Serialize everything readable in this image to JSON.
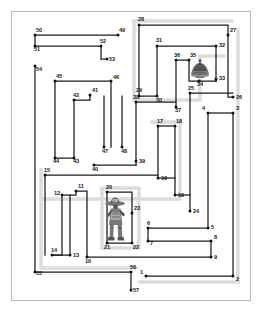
{
  "document": {
    "type": "maze-floorplan-diagram",
    "title": "",
    "canvas": {
      "width": 261,
      "height": 311
    },
    "background_color": "#ffffff",
    "frame_color": "#b9b9b9",
    "wall_color": "#1c1c1c",
    "halo_color": "#dcdcdc"
  },
  "frame": {
    "x": 11,
    "y": 11,
    "width": 239,
    "height": 289
  },
  "nodes": [
    {
      "id": "1",
      "x": 146,
      "y": 276,
      "label_dx": -6,
      "label_dy": -1
    },
    {
      "id": "2",
      "x": 233,
      "y": 276,
      "label_dx": 3,
      "label_dy": 6
    },
    {
      "id": "3",
      "x": 233,
      "y": 113,
      "label_dx": 3,
      "label_dy": -2
    },
    {
      "id": "4",
      "x": 208,
      "y": 113,
      "label_dx": -6,
      "label_dy": -2
    },
    {
      "id": "5",
      "x": 208,
      "y": 228,
      "label_dx": 3,
      "label_dy": 2
    },
    {
      "id": "6",
      "x": 148,
      "y": 228,
      "label_dx": -1,
      "label_dy": -2
    },
    {
      "id": "7",
      "x": 148,
      "y": 241,
      "label_dx": 2,
      "label_dy": 5
    },
    {
      "id": "8",
      "x": 211,
      "y": 241,
      "label_dx": 3,
      "label_dy": -1
    },
    {
      "id": "9",
      "x": 211,
      "y": 257,
      "label_dx": 3,
      "label_dy": 3
    },
    {
      "id": "10",
      "x": 87,
      "y": 257,
      "label_dx": -2,
      "label_dy": 7
    },
    {
      "id": "11",
      "x": 76,
      "y": 191,
      "label_dx": 2,
      "label_dy": -2
    },
    {
      "id": "12",
      "x": 62,
      "y": 195,
      "label_dx": -8,
      "label_dy": 1
    },
    {
      "id": "13",
      "x": 70,
      "y": 255,
      "label_dx": 3,
      "label_dy": 3
    },
    {
      "id": "14",
      "x": 52,
      "y": 255,
      "label_dx": -1,
      "label_dy": -2
    },
    {
      "id": "15",
      "x": 45,
      "y": 175,
      "label_dx": -1,
      "label_dy": -2
    },
    {
      "id": "16",
      "x": 158,
      "y": 178,
      "label_dx": 3,
      "label_dy": 3
    },
    {
      "id": "17",
      "x": 158,
      "y": 126,
      "label_dx": -1,
      "label_dy": -2
    },
    {
      "id": "18",
      "x": 175,
      "y": 126,
      "label_dx": 1,
      "label_dy": -2
    },
    {
      "id": "19",
      "x": 175,
      "y": 195,
      "label_dx": 3,
      "label_dy": 3
    },
    {
      "id": "20",
      "x": 107,
      "y": 192,
      "label_dx": -1,
      "label_dy": -2
    },
    {
      "id": "21",
      "x": 107,
      "y": 243,
      "label_dx": -3,
      "label_dy": 7
    },
    {
      "id": "22",
      "x": 132,
      "y": 243,
      "label_dx": 1,
      "label_dy": 7
    },
    {
      "id": "23",
      "x": 132,
      "y": 213,
      "label_dx": 2,
      "label_dy": -2
    },
    {
      "id": "24",
      "x": 190,
      "y": 211,
      "label_dx": 3,
      "label_dy": 3
    },
    {
      "id": "25",
      "x": 190,
      "y": 93,
      "label_dx": -2,
      "label_dy": -2
    },
    {
      "id": "26",
      "x": 233,
      "y": 97,
      "label_dx": 3,
      "label_dy": 3
    },
    {
      "id": "27",
      "x": 228,
      "y": 35,
      "label_dx": 2,
      "label_dy": -2
    },
    {
      "id": "28",
      "x": 139,
      "y": 25,
      "label_dx": -1,
      "label_dy": -3
    },
    {
      "id": "29",
      "x": 139,
      "y": 96,
      "label_dx": -3,
      "label_dy": -3
    },
    {
      "id": "30",
      "x": 157,
      "y": 96,
      "label_dx": -1,
      "label_dy": 7
    },
    {
      "id": "31",
      "x": 157,
      "y": 46,
      "label_dx": -1,
      "label_dy": -3
    },
    {
      "id": "32",
      "x": 216,
      "y": 46,
      "label_dx": 3,
      "label_dy": 2
    },
    {
      "id": "33",
      "x": 216,
      "y": 79,
      "label_dx": 3,
      "label_dy": 2
    },
    {
      "id": "34",
      "x": 199,
      "y": 81,
      "label_dx": -2,
      "label_dy": 6
    },
    {
      "id": "35",
      "x": 189,
      "y": 60,
      "label_dx": 1,
      "label_dy": -2
    },
    {
      "id": "36",
      "x": 176,
      "y": 60,
      "label_dx": -2,
      "label_dy": -2
    },
    {
      "id": "37",
      "x": 176,
      "y": 107,
      "label_dx": -1,
      "label_dy": 6
    },
    {
      "id": "38",
      "x": 136,
      "y": 102,
      "label_dx": -3,
      "label_dy": -2
    },
    {
      "id": "39",
      "x": 136,
      "y": 161,
      "label_dx": 3,
      "label_dy": 3
    },
    {
      "id": "40",
      "x": 94,
      "y": 165,
      "label_dx": -2,
      "label_dy": 7
    },
    {
      "id": "41",
      "x": 90,
      "y": 95,
      "label_dx": 2,
      "label_dy": -2
    },
    {
      "id": "42",
      "x": 74,
      "y": 100,
      "label_dx": -1,
      "label_dy": -2
    },
    {
      "id": "43",
      "x": 74,
      "y": 158,
      "label_dx": -1,
      "label_dy": 6
    },
    {
      "id": "44",
      "x": 55,
      "y": 158,
      "label_dx": -2,
      "label_dy": 6
    },
    {
      "id": "45",
      "x": 55,
      "y": 81,
      "label_dx": 1,
      "label_dy": -2
    },
    {
      "id": "46",
      "x": 111,
      "y": 81,
      "label_dx": 2,
      "label_dy": -1
    },
    {
      "id": "47",
      "x": 104,
      "y": 147,
      "label_dx": -2,
      "label_dy": 7
    },
    {
      "id": "48",
      "x": 122,
      "y": 147,
      "label_dx": -1,
      "label_dy": 7
    },
    {
      "id": "49",
      "x": 118,
      "y": 35,
      "label_dx": 1,
      "label_dy": -2
    },
    {
      "id": "50",
      "x": 35,
      "y": 35,
      "label_dx": 1,
      "label_dy": -2
    },
    {
      "id": "51",
      "x": 35,
      "y": 46,
      "label_dx": -1,
      "label_dy": 6
    },
    {
      "id": "52",
      "x": 101,
      "y": 46,
      "label_dx": -1,
      "label_dy": -2
    },
    {
      "id": "53",
      "x": 107,
      "y": 59,
      "label_dx": 2,
      "label_dy": 3
    },
    {
      "id": "54",
      "x": 35,
      "y": 66,
      "label_dx": 1,
      "label_dy": 6
    },
    {
      "id": "55",
      "x": 35,
      "y": 272,
      "label_dx": 1,
      "label_dy": 4
    },
    {
      "id": "56",
      "x": 131,
      "y": 272,
      "label_dx": -1,
      "label_dy": -2
    },
    {
      "id": "57",
      "x": 131,
      "y": 290,
      "label_dx": 2,
      "label_dy": 3
    }
  ],
  "wall_paths": [
    {
      "name": "path-50-51-52-53",
      "d": "M 35 35 L 118 35 M 35 35 L 35 46 L 101 46 L 101 59 L 107 59"
    },
    {
      "name": "path-54-44-43-40-39",
      "d": "M 35 66 L 35 272"
    },
    {
      "name": "path-45-46",
      "d": "M 55 81 L 111 81 L 111 147"
    },
    {
      "name": "path-45-44",
      "d": "M 55 81 L 55 158 L 74 158"
    },
    {
      "name": "path-42-41",
      "d": "M 74 100 L 90 100 L 90 95"
    },
    {
      "name": "path-42-43",
      "d": "M 74 100 L 74 158"
    },
    {
      "name": "path-47-48",
      "d": "M 104 147 L 104 96 M 122 147 L 122 96"
    },
    {
      "name": "path-40-39",
      "d": "M 94 165 L 136 165"
    },
    {
      "name": "path-38-39",
      "d": "M 136 102 L 136 165"
    },
    {
      "name": "path-38-37",
      "d": "M 136 102 L 176 102"
    },
    {
      "name": "path-37-36-35",
      "d": "M 176 107 L 176 60 L 189 60"
    },
    {
      "name": "path-35-34",
      "d": "M 189 60 L 189 81 L 216 81"
    },
    {
      "name": "path-31-32",
      "d": "M 157 46 L 216 46 L 216 81"
    },
    {
      "name": "path-31-30",
      "d": "M 157 46 L 157 96"
    },
    {
      "name": "path-28-29",
      "d": "M 139 25 L 139 96 L 157 96"
    },
    {
      "name": "path-28-27",
      "d": "M 139 25 L 228 25 L 228 35"
    },
    {
      "name": "path-27-26",
      "d": "M 228 35 L 228 97 L 233 97"
    },
    {
      "name": "path-25-26",
      "d": "M 190 93 L 233 93"
    },
    {
      "name": "path-25-24",
      "d": "M 190 93 L 190 211"
    },
    {
      "name": "path-17-18",
      "d": "M 158 126 L 175 126"
    },
    {
      "name": "path-17-16",
      "d": "M 158 126 L 158 178"
    },
    {
      "name": "path-18-19",
      "d": "M 175 126 L 175 195"
    },
    {
      "name": "path-15-20",
      "d": "M 45 175 L 45 255 M 45 175 L 158 175"
    },
    {
      "name": "path-16-19",
      "d": "M 158 178 L 175 178"
    },
    {
      "name": "path-19-24",
      "d": "M 175 195 L 190 195"
    },
    {
      "name": "path-20-23",
      "d": "M 107 192 L 132 192 L 132 243"
    },
    {
      "name": "path-20-21",
      "d": "M 107 192 L 107 243 L 132 243"
    },
    {
      "name": "path-11-12",
      "d": "M 62 195 L 76 195 L 76 191"
    },
    {
      "name": "path-12-14",
      "d": "M 62 195 L 62 255 L 52 255"
    },
    {
      "name": "path-13-10",
      "d": "M 70 255 L 70 195 M 52 255 L 70 255"
    },
    {
      "name": "path-10-11",
      "d": "M 87 257 L 87 191 L 76 191"
    },
    {
      "name": "path-10-9",
      "d": "M 87 257 L 211 257"
    },
    {
      "name": "path-8-7",
      "d": "M 211 241 L 148 241 L 148 228"
    },
    {
      "name": "path-6-5",
      "d": "M 148 228 L 208 228"
    },
    {
      "name": "path-5-4",
      "d": "M 208 228 L 208 113"
    },
    {
      "name": "path-4-3",
      "d": "M 208 113 L 233 113"
    },
    {
      "name": "path-3-2",
      "d": "M 233 113 L 233 276"
    },
    {
      "name": "path-2-1",
      "d": "M 233 276 L 146 276"
    },
    {
      "name": "path-55-56",
      "d": "M 35 272 L 131 272 L 131 290"
    },
    {
      "name": "path-9-8",
      "d": "M 211 257 L 211 241"
    },
    {
      "name": "path-33-26",
      "d": "M 216 79 L 216 81"
    }
  ],
  "halo_paths": [
    {
      "name": "halo-upper-right-room",
      "d": "M 134 21 L 134 100 L 200 100 L 200 56 L 224 56"
    },
    {
      "name": "halo-corridor-center",
      "d": "M 152 122 L 180 122 L 180 199 L 41 199"
    },
    {
      "name": "halo-lower-room",
      "d": "M 102 188 L 139 188 L 139 248 L 102 248 Z"
    },
    {
      "name": "halo-bottom-left",
      "d": "M 41 170 L 41 268 L 136 268"
    },
    {
      "name": "halo-right-edge",
      "d": "M 238 30 L 238 282 L 140 282"
    },
    {
      "name": "halo-top-right",
      "d": "M 134 21 L 232 21"
    }
  ],
  "glyphs": [
    {
      "name": "bell-lamp-glyph",
      "near_node": "34",
      "x": 192,
      "y": 62,
      "width": 16,
      "height": 18,
      "description": "small bell / lampshade shape"
    },
    {
      "name": "figure-glyph",
      "near_node": "20",
      "x": 104,
      "y": 196,
      "width": 25,
      "height": 46,
      "description": "standing figure wearing a wide-brimmed hat"
    }
  ]
}
